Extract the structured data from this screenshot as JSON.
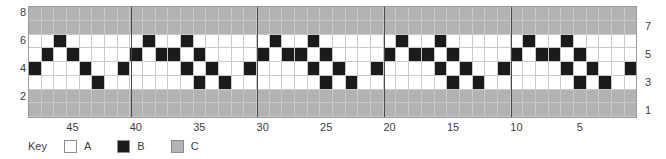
{
  "chart_data": {
    "type": "heatmap",
    "title": "",
    "xlabel": "",
    "ylabel": "",
    "columns": 48,
    "rows": 8,
    "xlim": [
      48,
      1
    ],
    "ylim": [
      1,
      8
    ],
    "x_direction": "right-to-left",
    "grid": true,
    "legend_position": "below",
    "x_tick_labels": [
      "45",
      "40",
      "35",
      "30",
      "25",
      "20",
      "15",
      "10",
      "5"
    ],
    "x_tick_values": [
      45,
      40,
      35,
      30,
      25,
      20,
      15,
      10,
      5
    ],
    "y_tick_labels_left": [
      "8",
      "6",
      "4",
      "2"
    ],
    "y_tick_values_left": [
      8,
      6,
      4,
      2
    ],
    "y_tick_labels_right": [
      "7",
      "5",
      "3",
      "1"
    ],
    "y_tick_values_right": [
      7,
      5,
      3,
      1
    ],
    "repeat_separators": [
      40,
      30,
      20,
      10
    ],
    "symbol_colors": {
      "A": "#ffffff",
      "B": "#1b1b1b",
      "C": "#b3b3b3"
    },
    "rows_data": [
      {
        "row": 8,
        "cells": [
          "C",
          "C",
          "C",
          "C",
          "C",
          "C",
          "C",
          "C",
          "C",
          "C",
          "C",
          "C",
          "C",
          "C",
          "C",
          "C",
          "C",
          "C",
          "C",
          "C",
          "C",
          "C",
          "C",
          "C",
          "C",
          "C",
          "C",
          "C",
          "C",
          "C",
          "C",
          "C",
          "C",
          "C",
          "C",
          "C",
          "C",
          "C",
          "C",
          "C",
          "C",
          "C",
          "C",
          "C",
          "C",
          "C",
          "C",
          "C"
        ]
      },
      {
        "row": 7,
        "cells": [
          "C",
          "C",
          "C",
          "C",
          "C",
          "C",
          "C",
          "C",
          "C",
          "C",
          "C",
          "C",
          "C",
          "C",
          "C",
          "C",
          "C",
          "C",
          "C",
          "C",
          "C",
          "C",
          "C",
          "C",
          "C",
          "C",
          "C",
          "C",
          "C",
          "C",
          "C",
          "C",
          "C",
          "C",
          "C",
          "C",
          "C",
          "C",
          "C",
          "C",
          "C",
          "C",
          "C",
          "C",
          "C",
          "C",
          "C",
          "C"
        ]
      },
      {
        "row": 6,
        "cells": [
          "A",
          "A",
          "B",
          "A",
          "A",
          "A",
          "A",
          "A",
          "A",
          "B",
          "A",
          "A",
          "B",
          "A",
          "A",
          "A",
          "A",
          "A",
          "A",
          "B",
          "A",
          "A",
          "B",
          "A",
          "A",
          "A",
          "A",
          "A",
          "A",
          "B",
          "A",
          "A",
          "B",
          "A",
          "A",
          "A",
          "A",
          "A",
          "A",
          "B",
          "A",
          "A",
          "B",
          "A",
          "A",
          "A",
          "A",
          "A"
        ]
      },
      {
        "row": 5,
        "cells": [
          "A",
          "B",
          "A",
          "B",
          "A",
          "A",
          "A",
          "A",
          "B",
          "A",
          "B",
          "B",
          "A",
          "B",
          "A",
          "A",
          "A",
          "A",
          "B",
          "A",
          "B",
          "B",
          "A",
          "B",
          "A",
          "A",
          "A",
          "A",
          "B",
          "A",
          "B",
          "B",
          "A",
          "B",
          "A",
          "A",
          "A",
          "A",
          "B",
          "A",
          "B",
          "B",
          "A",
          "B",
          "A",
          "A",
          "A",
          "A"
        ]
      },
      {
        "row": 4,
        "cells": [
          "B",
          "A",
          "A",
          "A",
          "B",
          "A",
          "A",
          "B",
          "A",
          "A",
          "A",
          "A",
          "B",
          "A",
          "B",
          "A",
          "A",
          "B",
          "A",
          "A",
          "A",
          "A",
          "B",
          "A",
          "B",
          "A",
          "A",
          "B",
          "A",
          "A",
          "A",
          "A",
          "B",
          "A",
          "B",
          "A",
          "A",
          "B",
          "A",
          "A",
          "A",
          "A",
          "B",
          "A",
          "B",
          "A",
          "A",
          "B"
        ]
      },
      {
        "row": 3,
        "cells": [
          "A",
          "A",
          "A",
          "A",
          "A",
          "B",
          "A",
          "A",
          "A",
          "A",
          "A",
          "A",
          "A",
          "B",
          "A",
          "B",
          "A",
          "A",
          "A",
          "A",
          "A",
          "A",
          "A",
          "B",
          "A",
          "B",
          "A",
          "A",
          "A",
          "A",
          "A",
          "A",
          "A",
          "B",
          "A",
          "B",
          "A",
          "A",
          "A",
          "A",
          "A",
          "A",
          "A",
          "B",
          "A",
          "B",
          "A",
          "A"
        ]
      },
      {
        "row": 2,
        "cells": [
          "C",
          "C",
          "C",
          "C",
          "C",
          "C",
          "C",
          "C",
          "C",
          "C",
          "C",
          "C",
          "C",
          "C",
          "C",
          "C",
          "C",
          "C",
          "C",
          "C",
          "C",
          "C",
          "C",
          "C",
          "C",
          "C",
          "C",
          "C",
          "C",
          "C",
          "C",
          "C",
          "C",
          "C",
          "C",
          "C",
          "C",
          "C",
          "C",
          "C",
          "C",
          "C",
          "C",
          "C",
          "C",
          "C",
          "C",
          "C"
        ]
      },
      {
        "row": 1,
        "cells": [
          "C",
          "C",
          "C",
          "C",
          "C",
          "C",
          "C",
          "C",
          "C",
          "C",
          "C",
          "C",
          "C",
          "C",
          "C",
          "C",
          "C",
          "C",
          "C",
          "C",
          "C",
          "C",
          "C",
          "C",
          "C",
          "C",
          "C",
          "C",
          "C",
          "C",
          "C",
          "C",
          "C",
          "C",
          "C",
          "C",
          "C",
          "C",
          "C",
          "C",
          "C",
          "C",
          "C",
          "C",
          "C",
          "C",
          "C",
          "C"
        ]
      }
    ]
  },
  "legend": {
    "title": "Key",
    "entries": [
      {
        "symbol": "A",
        "label": "A",
        "color": "#ffffff"
      },
      {
        "symbol": "B",
        "label": "B",
        "color": "#1b1b1b"
      },
      {
        "symbol": "C",
        "label": "C",
        "color": "#b3b3b3"
      }
    ]
  }
}
